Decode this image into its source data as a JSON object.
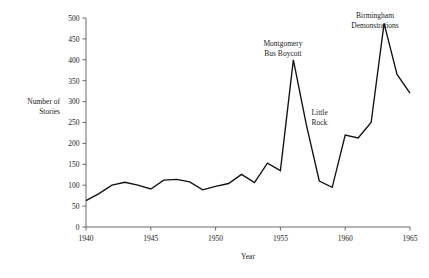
{
  "chart_data": {
    "type": "line",
    "title": "",
    "xlabel": "Year",
    "ylabel": "Number of Stories",
    "ylabel_lines": [
      "Number of",
      "Stories"
    ],
    "xlim": [
      1940,
      1965
    ],
    "ylim": [
      0,
      500
    ],
    "grid": false,
    "legend": "none",
    "x_ticks": [
      1940,
      1945,
      1950,
      1955,
      1960,
      1965
    ],
    "x_tick_labels": [
      "1940",
      "1945",
      "1950",
      "1955",
      "1960",
      "1965"
    ],
    "y_ticks": [
      0,
      50,
      100,
      150,
      200,
      250,
      300,
      350,
      400,
      450,
      500
    ],
    "y_tick_labels": [
      "0",
      "50",
      "100",
      "150",
      "200",
      "250",
      "300",
      "350",
      "400",
      "450",
      "500"
    ],
    "x": [
      1940,
      1941,
      1942,
      1943,
      1944,
      1945,
      1946,
      1947,
      1948,
      1949,
      1950,
      1951,
      1952,
      1953,
      1954,
      1955,
      1956,
      1957,
      1958,
      1959,
      1960,
      1961,
      1962,
      1963,
      1964,
      1965
    ],
    "values": [
      63,
      80,
      100,
      107,
      100,
      91,
      112,
      114,
      108,
      89,
      97,
      104,
      126,
      106,
      153,
      135,
      400,
      245,
      110,
      95,
      220,
      213,
      250,
      487,
      365,
      320
    ],
    "series": [
      {
        "name": "Number of Stories",
        "values": [
          63,
          80,
          100,
          107,
          100,
          91,
          112,
          114,
          108,
          89,
          97,
          104,
          126,
          106,
          153,
          135,
          400,
          245,
          110,
          95,
          220,
          213,
          250,
          487,
          365,
          320
        ]
      }
    ],
    "annotations": [
      {
        "id": "montgomery-bus-boycott",
        "lines": [
          "Montgomery",
          "Bus Boycott"
        ],
        "x": 1955.2,
        "y": 432,
        "align": "middle"
      },
      {
        "id": "little-rock",
        "lines": [
          "Little",
          "Rock"
        ],
        "x": 1957.4,
        "y": 268,
        "align": "start"
      },
      {
        "id": "birmingham-demonstrations",
        "lines": [
          "Birmingham",
          "Demonstrations"
        ],
        "x": 1962.3,
        "y": 500,
        "align": "middle"
      }
    ],
    "colors": {
      "line": "#111111",
      "axis": "#555a5e",
      "text": "#1a1a1a",
      "background": "#ffffff"
    }
  }
}
